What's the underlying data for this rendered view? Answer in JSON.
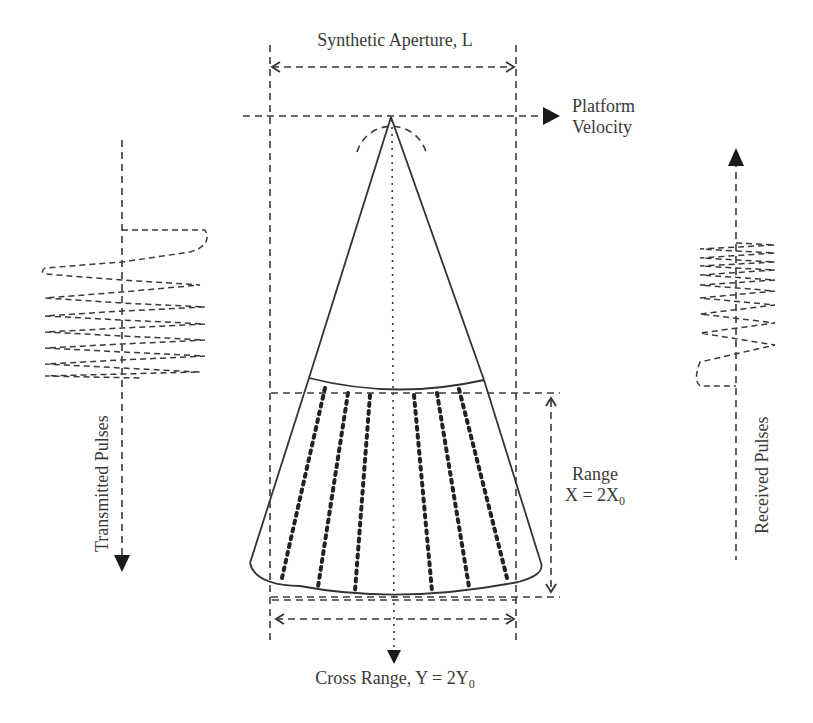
{
  "labels": {
    "synthetic_aperture": "Synthetic Aperture, L",
    "platform_velocity_line1": "Platform",
    "platform_velocity_line2": "Velocity",
    "transmitted_pulses": "Transmitted Pulses",
    "received_pulses": "Received Pulses",
    "range_line1": "Range",
    "range_line2_main": "X = 2X",
    "range_line2_sub": "0",
    "cross_range_main": "Cross Range, Y = 2Y",
    "cross_range_sub": "0"
  },
  "colors": {
    "stroke": "#3a3a3a",
    "text": "#3a3a3a",
    "background": "#ffffff"
  }
}
